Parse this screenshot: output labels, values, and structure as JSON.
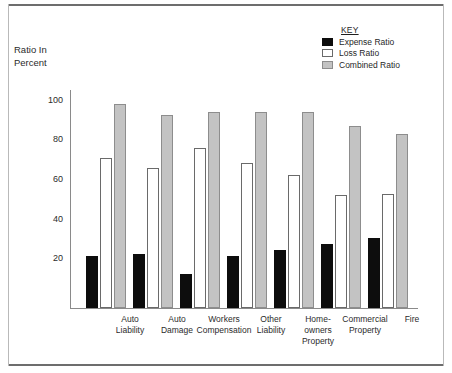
{
  "chart_data": {
    "type": "bar",
    "title": "",
    "xlabel": "",
    "ylabel": "Ratio In Percent",
    "ylabel_lines": [
      "Ratio In",
      "Percent"
    ],
    "ylim": [
      0,
      110
    ],
    "yticks": [
      20,
      40,
      60,
      80,
      100
    ],
    "ytick_labels": [
      "20",
      "40",
      "60",
      "80",
      "100"
    ],
    "grid": false,
    "legend_position": "top-right",
    "categories": [
      "Auto Liability",
      "Auto Damage",
      "Workers Compensation",
      "Other Liability",
      "Home-owners Property",
      "Commercial Property",
      "Fire"
    ],
    "category_lines": [
      [
        "Auto",
        "Liability"
      ],
      [
        "Auto",
        "Damage"
      ],
      [
        "Workers",
        "Compensation"
      ],
      [
        "Other",
        "Liability"
      ],
      [
        "Home-",
        "owners",
        "Property"
      ],
      [
        "Commercial",
        "Property"
      ],
      [
        "Fire"
      ]
    ],
    "series": [
      {
        "name": "Expense Ratio",
        "color": "#0d0d0d",
        "values": [
          26,
          27.5,
          17,
          26,
          29.5,
          32.5,
          35.5
        ]
      },
      {
        "name": "Loss Ratio",
        "color": "#ffffff",
        "values": [
          75.5,
          70.5,
          80.5,
          73,
          67,
          57,
          57.5
        ]
      },
      {
        "name": "Combined Ratio",
        "color": "#c3c3c3",
        "values": [
          103,
          97.5,
          99,
          99,
          99,
          92,
          88
        ]
      }
    ]
  },
  "legend": {
    "title": "KEY",
    "entries": [
      {
        "label": "Expense Ratio",
        "swatch": "black-filled-swatch"
      },
      {
        "label": "Loss Ratio",
        "swatch": "white-outline-swatch"
      },
      {
        "label": "Combined Ratio",
        "swatch": "gray-filled-swatch"
      }
    ]
  }
}
